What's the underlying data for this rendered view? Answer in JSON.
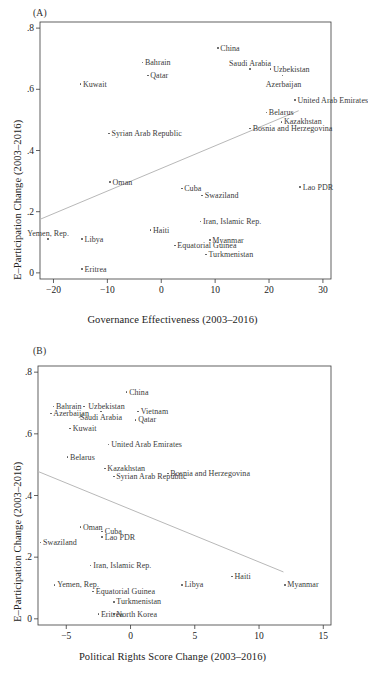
{
  "figure": {
    "background": "#ffffff",
    "marker_color": "#555555",
    "line_color": "#b8b8b8",
    "axis_color": "#3a3a3a"
  },
  "panels": [
    {
      "tag": "(A)",
      "xlabel": "Governance Effectiveness (2003–2016)",
      "ylabel": "E–Participation Change (2003–2016)",
      "xticks": [
        "−20",
        "−10",
        "0",
        "10",
        "20",
        "30"
      ],
      "xtickvals": [
        -20,
        -10,
        0,
        10,
        20,
        30
      ],
      "yticks": [
        "0",
        ".2",
        ".4",
        ".6",
        ".8"
      ],
      "ytickvals": [
        0,
        0.2,
        0.4,
        0.6,
        0.8
      ]
    },
    {
      "tag": "(B)",
      "xlabel": "Political Rights Score Change (2003–2016)",
      "ylabel": "E–Participation Change (2003–2016)",
      "xticks": [
        "−5",
        "0",
        "5",
        "10",
        "15"
      ],
      "xtickvals": [
        -5,
        0,
        5,
        10,
        15
      ],
      "yticks": [
        "0",
        ".2",
        ".4",
        ".6",
        ".8"
      ],
      "ytickvals": [
        0,
        0.2,
        0.4,
        0.6,
        0.8
      ]
    }
  ],
  "chart_data": [
    {
      "type": "scatter",
      "panel": "(A)",
      "title": "",
      "xlabel": "Governance Effectiveness (2003–2016)",
      "ylabel": "E–Participation Change (2003–2016)",
      "xlim": [
        -22.5,
        31.5
      ],
      "ylim": [
        -0.02,
        0.82
      ],
      "grid": false,
      "legend": "none",
      "trendline": {
        "x0": -22.5,
        "y0": 0.175,
        "x1": 25.5,
        "y1": 0.53
      },
      "points": [
        {
          "label": "China",
          "x": 10.5,
          "y": 0.735,
          "label_pos": "right"
        },
        {
          "label": "Bahrain",
          "x": -3.5,
          "y": 0.688,
          "label_pos": "right"
        },
        {
          "label": "Saudi Arabia",
          "x": 16.5,
          "y": 0.666,
          "label_pos": "above"
        },
        {
          "label": "Uzbekistan",
          "x": 20.3,
          "y": 0.666,
          "label_pos": "right"
        },
        {
          "label": "Azerbaijan",
          "x": 22.5,
          "y": 0.645,
          "label_pos": "below-right"
        },
        {
          "label": "Qatar",
          "x": -2.5,
          "y": 0.645,
          "label_pos": "right"
        },
        {
          "label": "Kuwait",
          "x": -15.0,
          "y": 0.617,
          "label_pos": "right"
        },
        {
          "label": "United Arab Emirates",
          "x": 24.8,
          "y": 0.565,
          "label_pos": "right"
        },
        {
          "label": "Belarus",
          "x": 19.5,
          "y": 0.524,
          "label_pos": "right"
        },
        {
          "label": "Kazakhstan",
          "x": 22.3,
          "y": 0.494,
          "label_pos": "right"
        },
        {
          "label": "Bosnia and Herzegovina",
          "x": 16.5,
          "y": 0.472,
          "label_pos": "right"
        },
        {
          "label": "Syrian Arab Republic",
          "x": -9.7,
          "y": 0.455,
          "label_pos": "right"
        },
        {
          "label": "Oman",
          "x": -9.5,
          "y": 0.297,
          "label_pos": "right"
        },
        {
          "label": "Lao PDR",
          "x": 25.8,
          "y": 0.28,
          "label_pos": "right"
        },
        {
          "label": "Cuba",
          "x": 3.8,
          "y": 0.276,
          "label_pos": "right"
        },
        {
          "label": "Swaziland",
          "x": 7.6,
          "y": 0.253,
          "label_pos": "right"
        },
        {
          "label": "Iran, Islamic Rep.",
          "x": 7.3,
          "y": 0.168,
          "label_pos": "right"
        },
        {
          "label": "Haiti",
          "x": -2.0,
          "y": 0.14,
          "label_pos": "right"
        },
        {
          "label": "Yemen, Rep.",
          "x": -21.0,
          "y": 0.11,
          "label_pos": "above"
        },
        {
          "label": "Libya",
          "x": -14.7,
          "y": 0.11,
          "label_pos": "right"
        },
        {
          "label": "Myanmar",
          "x": 9.0,
          "y": 0.107,
          "label_pos": "right"
        },
        {
          "label": "Equatorial Guinea",
          "x": 2.5,
          "y": 0.09,
          "label_pos": "right"
        },
        {
          "label": "Turkmenistan",
          "x": 8.3,
          "y": 0.06,
          "label_pos": "right"
        },
        {
          "label": "Eritrea",
          "x": -14.7,
          "y": 0.012,
          "label_pos": "right"
        }
      ]
    },
    {
      "type": "scatter",
      "panel": "(B)",
      "title": "",
      "xlabel": "Political Rights Score Change (2003–2016)",
      "ylabel": "E–Participation Change (2003–2016)",
      "xlim": [
        -7.2,
        15.6
      ],
      "ylim": [
        -0.02,
        0.82
      ],
      "grid": false,
      "legend": "none",
      "trendline": {
        "x0": -7.2,
        "y0": 0.478,
        "x1": 11.9,
        "y1": 0.152
      },
      "points": [
        {
          "label": "China",
          "x": -0.3,
          "y": 0.735,
          "label_pos": "right"
        },
        {
          "label": "Bahrain",
          "x": -6.0,
          "y": 0.688,
          "label_pos": "right"
        },
        {
          "label": "Uzbekistan",
          "x": -3.6,
          "y": 0.688,
          "label_pos": "right-far"
        },
        {
          "label": "Azerbaijan",
          "x": -6.2,
          "y": 0.666,
          "label_pos": "right"
        },
        {
          "label": "Saudi Arabia",
          "x": -2.3,
          "y": 0.672,
          "label_pos": "below"
        },
        {
          "label": "Vietnam",
          "x": 0.6,
          "y": 0.672,
          "label_pos": "right"
        },
        {
          "label": "Qatar",
          "x": 0.4,
          "y": 0.645,
          "label_pos": "right"
        },
        {
          "label": "Kuwait",
          "x": -4.7,
          "y": 0.617,
          "label_pos": "right"
        },
        {
          "label": "United Arab Emirates",
          "x": -1.7,
          "y": 0.565,
          "label_pos": "right"
        },
        {
          "label": "Belarus",
          "x": -4.9,
          "y": 0.524,
          "label_pos": "right"
        },
        {
          "label": "Kazakhstan",
          "x": -2.0,
          "y": 0.487,
          "label_pos": "right"
        },
        {
          "label": "Bosnia and Herzegovina",
          "x": 2.9,
          "y": 0.472,
          "label_pos": "right"
        },
        {
          "label": "Syrian Arab Republic",
          "x": -1.3,
          "y": 0.462,
          "label_pos": "right"
        },
        {
          "label": "Oman",
          "x": -3.9,
          "y": 0.297,
          "label_pos": "right"
        },
        {
          "label": "Cuba",
          "x": -2.2,
          "y": 0.283,
          "label_pos": "right"
        },
        {
          "label": "Lao PDR",
          "x": -2.2,
          "y": 0.265,
          "label_pos": "right"
        },
        {
          "label": "Swaziland",
          "x": -7.0,
          "y": 0.248,
          "label_pos": "right"
        },
        {
          "label": "Iran, Islamic Rep.",
          "x": -3.1,
          "y": 0.173,
          "label_pos": "right"
        },
        {
          "label": "Haiti",
          "x": 7.9,
          "y": 0.137,
          "label_pos": "right"
        },
        {
          "label": "Yemen, Rep.",
          "x": -5.9,
          "y": 0.11,
          "label_pos": "right"
        },
        {
          "label": "Libya",
          "x": 4.0,
          "y": 0.11,
          "label_pos": "right"
        },
        {
          "label": "Myanmar",
          "x": 12.0,
          "y": 0.11,
          "label_pos": "right"
        },
        {
          "label": "Equatorial Guinea",
          "x": -2.9,
          "y": 0.088,
          "label_pos": "right"
        },
        {
          "label": "Turkmenistan",
          "x": -1.3,
          "y": 0.055,
          "label_pos": "right"
        },
        {
          "label": "Eritrea",
          "x": -2.5,
          "y": 0.015,
          "label_pos": "right"
        },
        {
          "label": "North Korea",
          "x": -1.3,
          "y": 0.015,
          "label_pos": "right"
        }
      ]
    }
  ]
}
